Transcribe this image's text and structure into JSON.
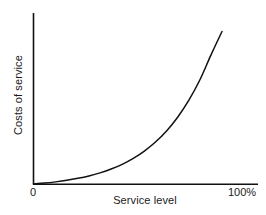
{
  "chart_data": {
    "type": "line",
    "title": "",
    "subtitle": "",
    "xlabel": "Service level",
    "ylabel": "Costs of service",
    "x_tick_labels": [
      "0",
      "100%"
    ],
    "y_tick_labels": [],
    "grid": false,
    "legend": null,
    "annotations": [],
    "xlim": [
      0,
      100
    ],
    "ylim": [
      0,
      100
    ],
    "series": [
      {
        "name": "Costs of service",
        "shape": "exponential",
        "x": [
          0,
          5,
          10,
          15,
          20,
          25,
          30,
          35,
          40,
          45,
          50,
          55,
          60,
          65,
          70,
          75,
          80,
          85
        ],
        "y": [
          0,
          0.6,
          1.4,
          2.4,
          3.7,
          5.3,
          7.3,
          9.8,
          12.9,
          16.8,
          21.6,
          27.5,
          34.8,
          43.8,
          54.8,
          68.2,
          84.5,
          100
        ]
      }
    ],
    "colors": {
      "line": "#111111",
      "axis": "#111111",
      "background": "#ffffff",
      "text": "#1a1a1a"
    }
  },
  "figure": {
    "xlabel": "Service level",
    "ylabel": "Costs of service",
    "tick_origin": "0",
    "tick_max": "100%"
  }
}
